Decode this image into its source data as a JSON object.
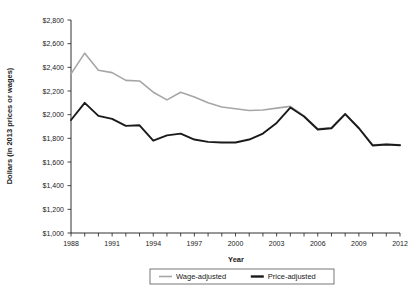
{
  "chart_data": {
    "type": "line",
    "title": "",
    "xlabel": "Year",
    "ylabel": "Dollars (in 2013 prices or wages)",
    "xlim": [
      1988,
      2012
    ],
    "ylim": [
      1000,
      2800
    ],
    "y_ticks": [
      1000,
      1200,
      1400,
      1600,
      1800,
      2000,
      2200,
      2400,
      2600,
      2800
    ],
    "y_tick_labels": [
      "$1,000",
      "$1,200",
      "$1,400",
      "$1,600",
      "$1,800",
      "$2,000",
      "$2,200",
      "$2,400",
      "$2,600",
      "$2,800"
    ],
    "x_ticks": [
      1988,
      1989,
      1990,
      1991,
      1992,
      1993,
      1994,
      1995,
      1996,
      1997,
      1998,
      1999,
      2000,
      2001,
      2002,
      2003,
      2004,
      2005,
      2006,
      2007,
      2008,
      2009,
      2010,
      2011,
      2012
    ],
    "x_tick_labels_shown": [
      "1988",
      "1991",
      "1994",
      "1997",
      "2000",
      "2003",
      "2006",
      "2009",
      "2012"
    ],
    "x_label_interval": 3,
    "grid": false,
    "legend_position": "bottom",
    "x": [
      1988,
      1989,
      1990,
      1991,
      1992,
      1993,
      1994,
      1995,
      1996,
      1997,
      1998,
      1999,
      2000,
      2001,
      2002,
      2003,
      2004,
      2005,
      2006,
      2007,
      2008,
      2009,
      2010,
      2011,
      2012
    ],
    "series": [
      {
        "name": "Wage-adjusted",
        "color": "#a6a6a6",
        "width": 1.6,
        "values": [
          2345,
          2520,
          2375,
          2355,
          2290,
          2285,
          2190,
          2125,
          2190,
          2150,
          2100,
          2065,
          2050,
          2035,
          2040,
          2055,
          2070,
          1990,
          1880,
          1890,
          2010,
          1890,
          1745,
          1750,
          1745
        ]
      },
      {
        "name": "Price-adjusted",
        "color": "#1a1a1a",
        "width": 1.9,
        "values": [
          1955,
          2100,
          1990,
          1965,
          1905,
          1910,
          1780,
          1825,
          1840,
          1790,
          1770,
          1765,
          1765,
          1790,
          1840,
          1930,
          2060,
          1985,
          1875,
          1885,
          2005,
          1885,
          1740,
          1748,
          1742
        ]
      }
    ],
    "legend": [
      {
        "label": "Wage-adjusted",
        "color": "#a6a6a6",
        "width": 1.6
      },
      {
        "label": "Price-adjusted",
        "color": "#1a1a1a",
        "width": 2.4
      }
    ]
  },
  "geometry": {
    "plot_left": 71,
    "plot_right": 400,
    "plot_top": 20,
    "plot_bottom": 233
  }
}
